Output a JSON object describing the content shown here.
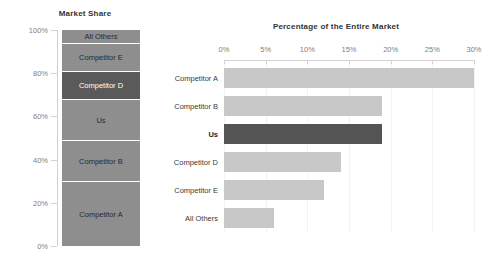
{
  "stacked": {
    "title": "Market Share",
    "y_ticks": [
      "100%",
      "80%",
      "60%",
      "40%",
      "20%",
      "0%"
    ],
    "segments": [
      {
        "label": "All Others",
        "start": 94,
        "end": 100,
        "highlight": false
      },
      {
        "label": "Competitor E",
        "start": 81,
        "end": 94,
        "highlight": false
      },
      {
        "label": "Competitor D",
        "start": 68,
        "end": 81,
        "highlight": true
      },
      {
        "label": "Us",
        "start": 49,
        "end": 68,
        "highlight": false
      },
      {
        "label": "Competitor B",
        "start": 30,
        "end": 49,
        "highlight": false
      },
      {
        "label": "Competitor A",
        "start": 0,
        "end": 30,
        "highlight": false
      }
    ]
  },
  "bars": {
    "title": "Percentage of the Entire Market",
    "x_ticks": [
      "0%",
      "5%",
      "10%",
      "15%",
      "20%",
      "25%",
      "30%"
    ],
    "x_tick_values": [
      0,
      5,
      10,
      15,
      20,
      25,
      30
    ],
    "rows": [
      {
        "label": "Competitor A",
        "value": 30,
        "highlight": false
      },
      {
        "label": "Competitor B",
        "value": 19,
        "highlight": false
      },
      {
        "label": "Us",
        "value": 19,
        "highlight": true
      },
      {
        "label": "Competitor D",
        "value": 14,
        "highlight": false
      },
      {
        "label": "Competitor E",
        "value": 12,
        "highlight": false
      },
      {
        "label": "All Others",
        "value": 6,
        "highlight": false
      }
    ]
  },
  "colors": {
    "bar_default": "#c8c8c8",
    "bar_highlight": "#545454",
    "segment_default": "#8e8e8e",
    "segment_highlight": "#5a5a5a",
    "axis": "#d2d2d2",
    "grid": "#f2f2f2",
    "tick_text": "#808080",
    "title_text": "#333333",
    "background": "#ffffff"
  },
  "chart_data": [
    {
      "type": "bar",
      "orientation": "vertical-stacked-100",
      "title": "Market Share",
      "xlabel": "",
      "ylabel": "",
      "ylim": [
        0,
        100
      ],
      "grid": false,
      "legend": "none",
      "categories": [
        "Competitor A",
        "Competitor B",
        "Us",
        "Competitor D",
        "Competitor E",
        "All Others"
      ],
      "values": [
        30,
        19,
        19,
        13,
        13,
        6
      ],
      "cumulative_boundaries": [
        0,
        30,
        49,
        68,
        81,
        94,
        100
      ],
      "tick_labels": [
        "0%",
        "20%",
        "40%",
        "60%",
        "80%",
        "100%"
      ],
      "highlighted": [
        "Competitor D"
      ],
      "units": "percent"
    },
    {
      "type": "bar",
      "orientation": "horizontal",
      "title": "Percentage of the Entire Market",
      "xlabel": "",
      "ylabel": "",
      "xlim": [
        0,
        30
      ],
      "grid": true,
      "legend": "none",
      "categories": [
        "Competitor A",
        "Competitor B",
        "Us",
        "Competitor D",
        "Competitor E",
        "All Others"
      ],
      "values": [
        30,
        19,
        19,
        14,
        12,
        6
      ],
      "tick_labels": [
        "0%",
        "5%",
        "10%",
        "15%",
        "20%",
        "25%",
        "30%"
      ],
      "highlighted": [
        "Us"
      ],
      "units": "percent"
    }
  ]
}
